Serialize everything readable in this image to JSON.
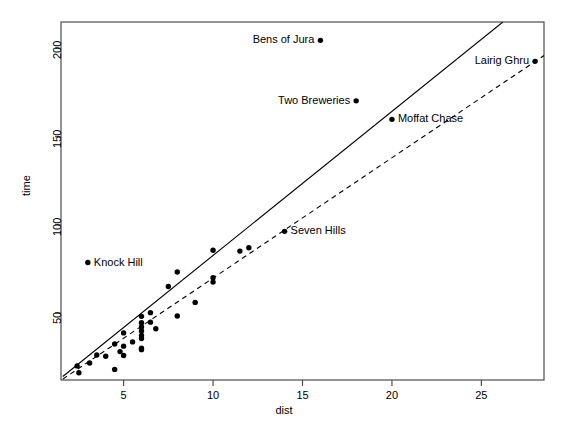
{
  "chart_data": {
    "type": "scatter",
    "title": "",
    "xlabel": "dist",
    "ylabel": "time",
    "xlim": [
      1.5,
      28.5
    ],
    "ylim": [
      12,
      215
    ],
    "xticks": [
      5,
      10,
      15,
      20,
      25
    ],
    "yticks": [
      50,
      100,
      150,
      200
    ],
    "grid": false,
    "legend": "none",
    "point_color": "#000000",
    "line_color": "#000000",
    "frame_color": "#4d4d4d",
    "series": [
      {
        "name": "hill races",
        "x": [
          2.5,
          2.4,
          3.1,
          3.5,
          4.0,
          4.5,
          4.5,
          4.8,
          5.0,
          5.0,
          5.0,
          5.5,
          6.0,
          6.0,
          6.0,
          6.0,
          6.0,
          6.0,
          6.0,
          6.0,
          6.5,
          6.5,
          6.8,
          7.5,
          8.0,
          8.0,
          9.0,
          10.0,
          10.0,
          10.0,
          11.5,
          12.0,
          14.0,
          16.0,
          18.0,
          20.0,
          28.0
        ],
        "y": [
          16.1,
          20.0,
          21.6,
          26.2,
          25.5,
          18.0,
          32.4,
          28.1,
          31.2,
          25.9,
          38.7,
          33.6,
          39.8,
          44.5,
          37.3,
          42.1,
          35.5,
          48.1,
          30.0,
          29.2,
          50.2,
          44.8,
          41.1,
          65.0,
          48.3,
          73.2,
          56.0,
          67.5,
          85.6,
          70.0,
          85.1,
          87.0,
          96.3,
          204.6,
          170.3,
          159.8,
          192.7
        ],
        "marker": "filled-circle"
      }
    ],
    "annotations": [
      {
        "label": "Bens of Jura",
        "x": 16.0,
        "y": 204.6,
        "text_side": "left"
      },
      {
        "label": "Two Breweries",
        "x": 18.0,
        "y": 170.3,
        "text_side": "left"
      },
      {
        "label": "Lairig Ghru",
        "x": 28.0,
        "y": 192.7,
        "text_side": "left"
      },
      {
        "label": "Moffat Chase",
        "x": 20.0,
        "y": 159.8,
        "text_side": "right"
      },
      {
        "label": "Seven Hills",
        "x": 14.0,
        "y": 96.3,
        "text_side": "right"
      },
      {
        "label": "Knock Hill",
        "x": 3.0,
        "y": 78.6,
        "text_side": "right"
      }
    ],
    "fit_lines": [
      {
        "name": "least-squares fit",
        "style": "solid",
        "x1": 1.6,
        "y1": 14.0,
        "x2": 26.2,
        "y2": 215.0
      },
      {
        "name": "robust fit",
        "style": "dashed",
        "x1": 1.6,
        "y1": 12.5,
        "x2": 28.5,
        "y2": 196.0
      }
    ]
  }
}
